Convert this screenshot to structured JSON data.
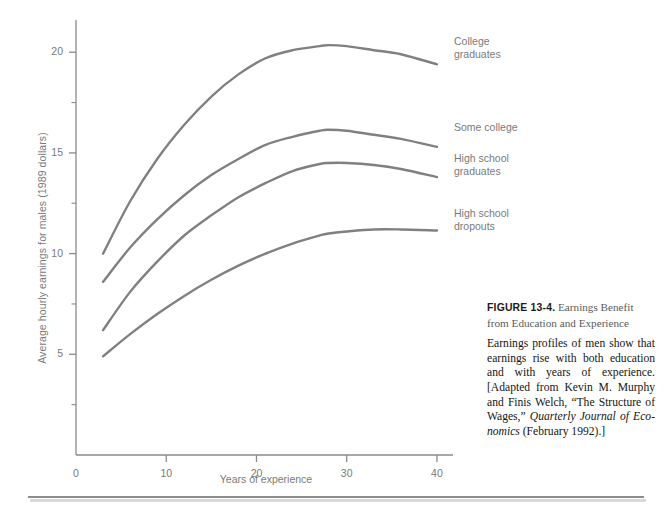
{
  "figure": {
    "caption_figure_number": "FIGURE 13-4.",
    "caption_title_rest": " Earnings Benefit from Education and Experience",
    "caption_body_part1": "Earnings profiles of men show that earnings rise with both education and with years of experience. [Adapted from Kevin M. Murphy and Finis Welch, “The Structure of Wages,” ",
    "caption_body_italic": "Quarterly Journal of Eco-nomics",
    "caption_body_part2": " (February 1992).]"
  },
  "chart_data": {
    "type": "line",
    "title": "",
    "xlabel": "Years of experience",
    "ylabel": "Average hourly earnings for males (1989 dollars)",
    "xlim": [
      0,
      42
    ],
    "ylim": [
      0,
      21.5
    ],
    "xticks": [
      0,
      10,
      20,
      30,
      40
    ],
    "xtick_labels": [
      "0",
      "10",
      "20",
      "30",
      "40"
    ],
    "yticks": [
      5,
      10,
      15,
      20
    ],
    "ytick_labels": [
      "5",
      "10",
      "15",
      "20"
    ],
    "yminorticks": [
      2.5,
      7.5,
      12.5,
      17.5
    ],
    "grid": false,
    "legend_position": "right-inline-labels",
    "line_color": "#808080",
    "line_width": 2.4,
    "x": [
      3,
      6,
      9,
      12,
      15,
      18,
      21,
      24,
      27,
      28,
      30,
      33,
      36,
      40
    ],
    "series": [
      {
        "name": "College graduates",
        "label": "College\ngraduates",
        "values": [
          10.0,
          12.6,
          14.7,
          16.4,
          17.8,
          18.9,
          19.7,
          20.1,
          20.3,
          20.35,
          20.3,
          20.1,
          19.9,
          19.4
        ]
      },
      {
        "name": "Some college",
        "label": "Some college",
        "values": [
          8.6,
          10.3,
          11.7,
          12.9,
          13.9,
          14.7,
          15.4,
          15.8,
          16.1,
          16.15,
          16.1,
          15.9,
          15.7,
          15.3
        ]
      },
      {
        "name": "High school graduates",
        "label": "High school\ngraduates",
        "values": [
          6.2,
          8.1,
          9.6,
          10.9,
          11.9,
          12.8,
          13.5,
          14.1,
          14.45,
          14.5,
          14.5,
          14.4,
          14.2,
          13.8
        ]
      },
      {
        "name": "High school dropouts",
        "label": "High school\ndropouts",
        "values": [
          4.9,
          6.0,
          7.0,
          7.9,
          8.7,
          9.4,
          10.0,
          10.5,
          10.9,
          11.0,
          11.1,
          11.2,
          11.2,
          11.15
        ]
      }
    ]
  },
  "curve_labels": [
    {
      "text": "College\ngraduates",
      "left": 454,
      "top": 35
    },
    {
      "text": "Some college",
      "left": 454,
      "top": 121
    },
    {
      "text": "High school\ngraduates",
      "left": 454,
      "top": 152
    },
    {
      "text": "High school\ndropouts",
      "left": 454,
      "top": 207
    }
  ]
}
